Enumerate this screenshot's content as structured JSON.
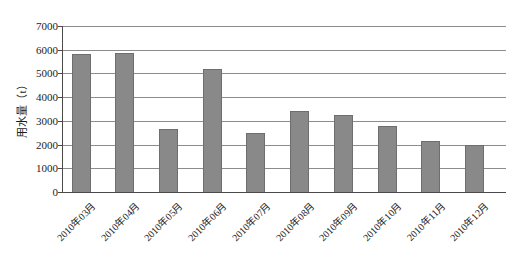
{
  "chart_data": {
    "type": "bar",
    "title": "",
    "xlabel": "",
    "ylabel": "用水量（t）",
    "categories": [
      "2010年03月",
      "2010年04月",
      "2010年05月",
      "2010年06月",
      "2010年07月",
      "2010年08月",
      "2010年09月",
      "2010年10月",
      "2010年11月",
      "2010年12月"
    ],
    "values": [
      5800,
      5850,
      2650,
      5200,
      2500,
      3400,
      3250,
      2800,
      2150,
      2000
    ],
    "ylim": [
      0,
      7000
    ],
    "ytick_interval": 1000,
    "ytick_labels": [
      "0",
      "1000",
      "2000",
      "3000",
      "4000",
      "5000",
      "6000",
      "7000"
    ],
    "grid": true,
    "legend_position": "none"
  },
  "colors": {
    "bar_fill": "#898989",
    "bar_border": "#6e6e6e",
    "gridline": "#8c8c8c",
    "axis": "#4a4a4a",
    "text": "#1c1c1c",
    "background": "#ffffff"
  }
}
